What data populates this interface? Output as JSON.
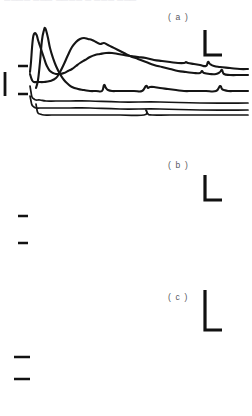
{
  "figure": {
    "clipped_header_text": "▁▁▁▁ ▁▁▁ ▁▁▁▁ ▁ ▁▁▁ ▁▁▁",
    "width": 252,
    "height": 416,
    "background_color": "#ffffff",
    "trace_color": "#151515",
    "label_color": "#57575e"
  },
  "panels": [
    {
      "id": "a",
      "label": "( a )",
      "label_x": 168,
      "label_y": 12,
      "response_trace_name": "panel-a-response-trace",
      "stimulus_trace_name": "panel-a-stimulus-trace",
      "scalebar_name": "panel-a-scale-bar",
      "baseline_markers": 2,
      "calibration_bar": true
    },
    {
      "id": "b",
      "label": "( b )",
      "label_x": 168,
      "label_y": 160,
      "response_trace_name": "panel-b-response-trace",
      "stimulus_trace_name": "panel-b-stimulus-trace",
      "scalebar_name": "panel-b-scale-bar",
      "baseline_markers": 2,
      "calibration_bar": false
    },
    {
      "id": "c",
      "label": "( c )",
      "label_x": 168,
      "label_y": 292,
      "response_trace_name": "panel-c-response-trace",
      "stimulus_trace_name": "panel-c-stimulus-trace",
      "scalebar_name": "panel-c-scale-bar",
      "baseline_markers": 2,
      "calibration_bar": false
    }
  ],
  "chart_data": {
    "type": "line",
    "title": "",
    "xlabel": "",
    "ylabel": "",
    "grid": false,
    "legend": "none",
    "axis_style": "scale-bars-only",
    "panels": [
      {
        "id": "a",
        "label": "( a )",
        "xlim": [
          0,
          252
        ],
        "ylim": [
          0,
          120
        ],
        "series": [
          {
            "name": "response",
            "x": [
              30,
              31,
              32,
              33,
              34,
              35,
              36,
              37,
              38,
              40,
              42,
              44,
              46,
              48,
              50,
              53,
              56,
              60,
              64,
              68,
              72,
              76,
              80,
              85,
              90,
              95,
              100,
              106,
              112,
              118,
              124,
              130,
              138,
              146,
              154,
              162,
              170,
              178,
              184,
              186,
              188,
              194,
              200,
              206,
              208,
              210,
              214,
              220,
              230,
              240,
              248
            ],
            "y": [
              72,
              62,
              48,
              38,
              34,
              33,
              34,
              36,
              40,
              46,
              52,
              58,
              64,
              68,
              71,
              73,
              74,
              74,
              73,
              71,
              69,
              66,
              63,
              60,
              57,
              55,
              54,
              53,
              53,
              54,
              55,
              56,
              57,
              58,
              60,
              61,
              62,
              63,
              63,
              62,
              63,
              64,
              65,
              66,
              62,
              64,
              66,
              67,
              68,
              69,
              69
            ]
          },
          {
            "name": "stimulus",
            "x": [
              30,
              31,
              32,
              34,
              36,
              40,
              46,
              56,
              70,
              90,
              120,
              160,
              200,
              248
            ],
            "y": [
              86,
              92,
              97,
              99,
              100,
              100,
              101,
              101,
              101,
              101,
              102,
              102,
              103,
              103
            ]
          }
        ],
        "scale_bar": {
          "x": 205,
          "y_top": 30,
          "y_bottom": 55,
          "x_left": 222,
          "corner": "bottom-left"
        },
        "baseline_markers": [
          {
            "x1": 18,
            "x2": 28,
            "y": 66
          },
          {
            "x1": 18,
            "x2": 28,
            "y": 94
          }
        ],
        "calibration_bar": {
          "x": 5,
          "y_top": 72,
          "y_bottom": 96
        }
      },
      {
        "id": "b",
        "label": "( b )",
        "xlim": [
          0,
          252
        ],
        "ylim": [
          0,
          120
        ],
        "series": [
          {
            "name": "response",
            "x": [
              30,
              32,
              34,
              38,
              44,
              50,
              56,
              60,
              64,
              68,
              72,
              76,
              80,
              84,
              88,
              92,
              96,
              100,
              104,
              108,
              112,
              118,
              124,
              130,
              138,
              146,
              154,
              162,
              170,
              178,
              186,
              194,
              200,
              202,
              204,
              210,
              216,
              220,
              222,
              224,
              230,
              240,
              248
            ],
            "y": [
              74,
              80,
              82,
              82,
              82,
              81,
              78,
              72,
              64,
              55,
              47,
              42,
              39,
              38,
              39,
              40,
              42,
              44,
              43,
              45,
              47,
              50,
              53,
              56,
              59,
              62,
              65,
              67,
              69,
              71,
              72,
              73,
              73,
              71,
              73,
              74,
              74,
              72,
              70,
              74,
              75,
              75,
              75
            ]
          },
          {
            "name": "stimulus",
            "x": [
              30,
              31,
              32,
              34,
              36,
              40,
              46,
              56,
              70,
              90,
              120,
              160,
              200,
              248
            ],
            "y": [
              96,
              101,
              105,
              107,
              108,
              108,
              108,
              108,
              108,
              108,
              109,
              109,
              110,
              110
            ]
          }
        ],
        "scale_bar": {
          "x": 205,
          "y_top": 175,
          "y_bottom": 200,
          "x_left": 222,
          "corner": "bottom-left"
        },
        "baseline_markers": [
          {
            "x1": 18,
            "x2": 28,
            "y": 216
          },
          {
            "x1": 18,
            "x2": 28,
            "y": 243
          }
        ],
        "calibration_bar": null
      },
      {
        "id": "c",
        "label": "( c )",
        "xlim": [
          0,
          252
        ],
        "ylim": [
          0,
          120
        ],
        "series": [
          {
            "name": "response",
            "x": [
              36,
              38,
              40,
              42,
              44,
              45,
              46,
              48,
              50,
              53,
              56,
              60,
              64,
              68,
              72,
              78,
              84,
              90,
              96,
              102,
              104,
              106,
              108,
              112,
              118,
              126,
              134,
              142,
              146,
              148,
              150,
              154,
              160,
              168,
              176,
              184,
              192,
              200,
              206,
              216,
              220,
              222,
              224,
              228,
              236,
              244,
              248
            ],
            "y": [
              88,
              80,
              62,
              40,
              30,
              28,
              30,
              38,
              48,
              58,
              66,
              74,
              80,
              84,
              87,
              89,
              90,
              91,
              91,
              91,
              85,
              88,
              90,
              91,
              91,
              91,
              91,
              91,
              86,
              88,
              87,
              87,
              88,
              89,
              90,
              91,
              91,
              91,
              91,
              91,
              86,
              89,
              90,
              91,
              91,
              91,
              91
            ]
          },
          {
            "name": "stimulus",
            "x": [
              36,
              37,
              38,
              40,
              44,
              52,
              66,
              90,
              120,
              144,
              146,
              148,
              152,
              170,
              200,
              248
            ],
            "y": [
              104,
              110,
              113,
              114,
              115,
              115,
              115,
              115,
              115,
              115,
              110,
              114,
              115,
              115,
              115,
              115
            ]
          }
        ],
        "scale_bar": {
          "x": 205,
          "y_top": 290,
          "y_bottom": 330,
          "x_left": 222,
          "corner": "bottom-left"
        },
        "baseline_markers": [
          {
            "x1": 14,
            "x2": 30,
            "y": 357
          },
          {
            "x1": 14,
            "x2": 30,
            "y": 379
          }
        ],
        "calibration_bar": null
      }
    ]
  }
}
